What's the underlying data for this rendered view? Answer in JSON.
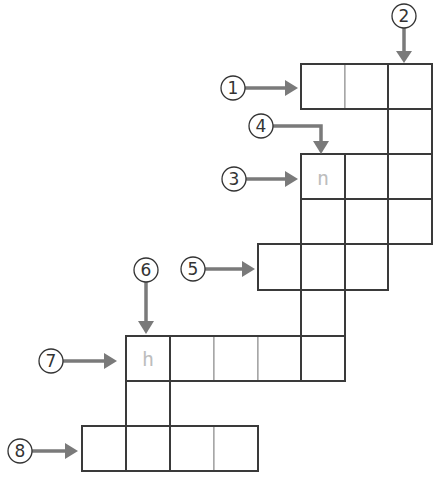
{
  "puzzle": {
    "type": "crossword-grid",
    "colors": {
      "grid_line": "#8a8a8a",
      "outline": "#3a3a3a",
      "arrow": "#7a7a7a",
      "hint_letter": "#bdbdbd",
      "circle_text": "#333333"
    },
    "clues": [
      {
        "number": "1",
        "direction": "across"
      },
      {
        "number": "2",
        "direction": "down"
      },
      {
        "number": "3",
        "direction": "across"
      },
      {
        "number": "4",
        "direction": "down"
      },
      {
        "number": "5",
        "direction": "across"
      },
      {
        "number": "6",
        "direction": "down"
      },
      {
        "number": "7",
        "direction": "across"
      },
      {
        "number": "8",
        "direction": "across"
      }
    ],
    "hint_letters": [
      {
        "clue": "3",
        "letter": "n"
      },
      {
        "clue": "7",
        "letter": "h"
      }
    ]
  }
}
